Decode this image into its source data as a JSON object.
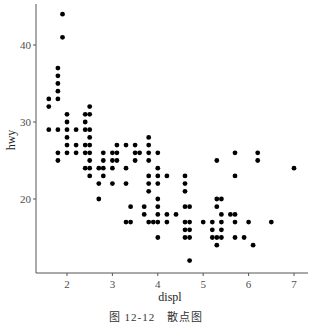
{
  "caption": "图 12-12　散点图",
  "chart_data": {
    "type": "scatter",
    "title": "",
    "xlabel": "displ",
    "ylabel": "hwy",
    "xlim": [
      1.4,
      7.3
    ],
    "ylim": [
      10.5,
      45
    ],
    "grid": false,
    "legend": null,
    "x_ticks": [
      2,
      3,
      4,
      5,
      6,
      7
    ],
    "y_ticks": [
      20,
      30,
      40
    ],
    "point_color": "#000000",
    "points": [
      [
        1.6,
        33
      ],
      [
        1.6,
        32
      ],
      [
        1.6,
        29
      ],
      [
        1.8,
        37
      ],
      [
        1.8,
        36
      ],
      [
        1.8,
        35
      ],
      [
        1.8,
        34
      ],
      [
        1.8,
        33
      ],
      [
        1.8,
        29
      ],
      [
        1.8,
        26
      ],
      [
        1.8,
        25
      ],
      [
        1.9,
        44
      ],
      [
        1.9,
        41
      ],
      [
        2.0,
        31
      ],
      [
        2.0,
        30
      ],
      [
        2.0,
        29
      ],
      [
        2.0,
        28
      ],
      [
        2.0,
        27
      ],
      [
        2.0,
        26
      ],
      [
        2.2,
        29
      ],
      [
        2.2,
        27
      ],
      [
        2.2,
        26
      ],
      [
        2.4,
        31
      ],
      [
        2.4,
        30
      ],
      [
        2.4,
        29
      ],
      [
        2.4,
        27
      ],
      [
        2.4,
        26
      ],
      [
        2.4,
        24
      ],
      [
        2.5,
        32
      ],
      [
        2.5,
        31
      ],
      [
        2.5,
        29
      ],
      [
        2.5,
        28
      ],
      [
        2.5,
        27
      ],
      [
        2.5,
        26
      ],
      [
        2.5,
        25
      ],
      [
        2.5,
        24
      ],
      [
        2.5,
        23
      ],
      [
        2.7,
        24
      ],
      [
        2.7,
        22
      ],
      [
        2.7,
        20
      ],
      [
        2.8,
        26
      ],
      [
        2.8,
        25
      ],
      [
        2.8,
        24
      ],
      [
        2.8,
        23
      ],
      [
        3.0,
        26
      ],
      [
        3.0,
        25
      ],
      [
        3.0,
        24
      ],
      [
        3.0,
        22
      ],
      [
        3.1,
        27
      ],
      [
        3.1,
        26
      ],
      [
        3.1,
        25
      ],
      [
        3.3,
        27
      ],
      [
        3.3,
        24
      ],
      [
        3.3,
        22
      ],
      [
        3.3,
        17
      ],
      [
        3.4,
        19
      ],
      [
        3.4,
        17
      ],
      [
        3.5,
        27
      ],
      [
        3.5,
        26
      ],
      [
        3.5,
        25
      ],
      [
        3.6,
        26
      ],
      [
        3.7,
        19
      ],
      [
        3.7,
        18
      ],
      [
        3.8,
        28
      ],
      [
        3.8,
        27
      ],
      [
        3.8,
        26
      ],
      [
        3.8,
        25
      ],
      [
        3.8,
        23
      ],
      [
        3.8,
        22
      ],
      [
        3.8,
        21
      ],
      [
        3.8,
        17
      ],
      [
        3.9,
        17
      ],
      [
        4.0,
        26
      ],
      [
        4.0,
        24
      ],
      [
        4.0,
        23
      ],
      [
        4.0,
        22
      ],
      [
        4.0,
        20
      ],
      [
        4.0,
        19
      ],
      [
        4.0,
        18
      ],
      [
        4.0,
        17
      ],
      [
        4.0,
        15
      ],
      [
        4.2,
        23
      ],
      [
        4.2,
        18
      ],
      [
        4.2,
        17
      ],
      [
        4.4,
        18
      ],
      [
        4.6,
        23
      ],
      [
        4.6,
        22
      ],
      [
        4.6,
        21
      ],
      [
        4.6,
        19
      ],
      [
        4.6,
        17
      ],
      [
        4.6,
        16
      ],
      [
        4.6,
        15
      ],
      [
        4.7,
        19
      ],
      [
        4.7,
        17
      ],
      [
        4.7,
        16
      ],
      [
        4.7,
        15
      ],
      [
        4.7,
        12
      ],
      [
        5.0,
        17
      ],
      [
        5.2,
        17
      ],
      [
        5.2,
        16
      ],
      [
        5.2,
        15
      ],
      [
        5.3,
        25
      ],
      [
        5.3,
        20
      ],
      [
        5.3,
        19
      ],
      [
        5.3,
        15
      ],
      [
        5.3,
        14
      ],
      [
        5.4,
        20
      ],
      [
        5.4,
        18
      ],
      [
        5.4,
        17
      ],
      [
        5.4,
        16
      ],
      [
        5.4,
        15
      ],
      [
        5.6,
        18
      ],
      [
        5.7,
        26
      ],
      [
        5.7,
        23
      ],
      [
        5.7,
        18
      ],
      [
        5.7,
        17
      ],
      [
        5.7,
        15
      ],
      [
        5.9,
        15
      ],
      [
        6.0,
        17
      ],
      [
        6.1,
        14
      ],
      [
        6.2,
        26
      ],
      [
        6.2,
        25
      ],
      [
        6.5,
        17
      ],
      [
        7.0,
        24
      ]
    ]
  }
}
